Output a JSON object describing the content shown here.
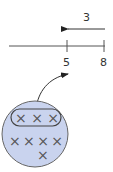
{
  "arrow": {
    "label": "3",
    "direction": "left"
  },
  "number_line": {
    "ticks": [
      {
        "label": "5"
      },
      {
        "label": "8"
      }
    ]
  },
  "group": {
    "rows": [
      {
        "marks": [
          "×",
          "×",
          "×"
        ],
        "circled": true
      },
      {
        "marks": [
          "×",
          "×",
          "×",
          "×"
        ],
        "circled": false
      },
      {
        "marks": [
          "×"
        ],
        "circled": false
      }
    ],
    "fill_color": "#c9d3ee",
    "stroke_color": "#555555"
  }
}
